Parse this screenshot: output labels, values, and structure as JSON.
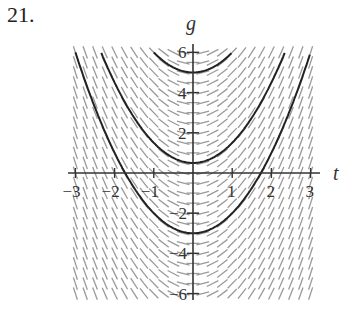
{
  "problem": {
    "number": "21."
  },
  "chart_data": {
    "type": "line",
    "title": "",
    "subtitle": "Slope field with solution curves",
    "xlabel": "t",
    "ylabel": "g",
    "xlim": [
      -3,
      3
    ],
    "ylim": [
      -6,
      6
    ],
    "x_ticks": [
      -3,
      -2,
      -1,
      1,
      2,
      3
    ],
    "y_ticks": [
      6,
      4,
      2,
      -2,
      -4,
      -6
    ],
    "x_tick_labels": [
      "−3",
      "−2",
      "−1",
      "1",
      "2",
      "3"
    ],
    "y_tick_labels": [
      "6",
      "4",
      "2",
      "−2",
      "−4",
      "−6"
    ],
    "grid": false,
    "slope_field": {
      "dg_dt": "2t",
      "t_step": 0.25,
      "g_step": 0.5,
      "color": "#9a9a9a"
    },
    "series": [
      {
        "name": "solution-curve-top",
        "formula": "g = t^2 + 5",
        "color": "#222222"
      },
      {
        "name": "solution-curve-middle",
        "formula": "g = t^2 + 0.5",
        "color": "#222222"
      },
      {
        "name": "solution-curve-bottom",
        "formula": "g = t^2 - 3",
        "color": "#222222"
      }
    ],
    "offsets": [
      5,
      0.5,
      -3
    ]
  }
}
